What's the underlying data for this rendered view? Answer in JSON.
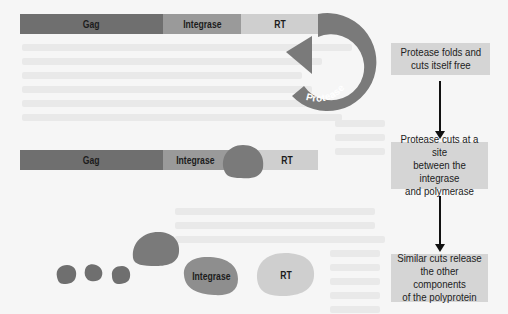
{
  "colors": {
    "gag": "#6f6f6f",
    "integrase": "#9a9a9a",
    "rt": "#cfcfcf",
    "protease": "#7a7a7a",
    "box": "#d5d5d5",
    "arrow": "#111111",
    "background": "#f6f6f6"
  },
  "polyprotein_initial": {
    "segments": [
      {
        "label": "Gag"
      },
      {
        "label": "Integrase"
      },
      {
        "label": "RT"
      }
    ],
    "protease_arrow_label": "Protease"
  },
  "polyprotein_cut": {
    "segments": [
      {
        "label": "Gag"
      },
      {
        "label": "Integrase"
      },
      {
        "label": "RT"
      }
    ]
  },
  "released_proteins": {
    "integrase_label": "Integrase",
    "rt_label": "RT"
  },
  "steps": [
    {
      "lines": [
        "Protease folds and",
        "cuts itself free"
      ]
    },
    {
      "lines": [
        "Protease cuts at a site",
        "between the integrase",
        "and polymerase"
      ]
    },
    {
      "lines": [
        "Similar cuts release",
        "the other components",
        "of the polyprotein"
      ]
    }
  ]
}
